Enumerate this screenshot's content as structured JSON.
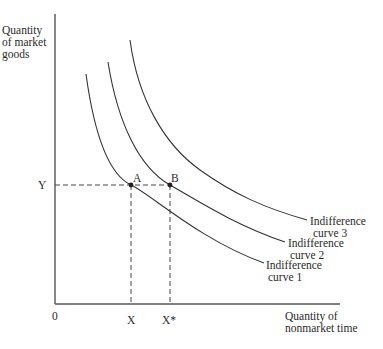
{
  "diagram": {
    "type": "indifference-curve-diagram",
    "y_axis_label_lines": [
      "Quantity",
      "of market",
      "goods"
    ],
    "x_axis_label_lines": [
      "Quantity of",
      "nonmarket time"
    ],
    "origin_label": "0",
    "y_tick": "Y",
    "x_ticks": [
      "X",
      "X*"
    ],
    "points": [
      {
        "label": "A",
        "x": "X",
        "y": "Y",
        "on_curve": "Indifference curve 1"
      },
      {
        "label": "B",
        "x": "X*",
        "y": "Y",
        "on_curve": "Indifference curve 2"
      }
    ],
    "curves": [
      {
        "name": "Indifference curve 1",
        "lines": [
          "Indifference",
          "curve 1"
        ]
      },
      {
        "name": "Indifference curve 2",
        "lines": [
          "Indifference",
          "curve 2"
        ]
      },
      {
        "name": "Indifference curve 3",
        "lines": [
          "Indifference",
          "curve 3"
        ]
      }
    ],
    "colors": {
      "ink": "#2a2a2a",
      "background": "#ffffff"
    }
  }
}
